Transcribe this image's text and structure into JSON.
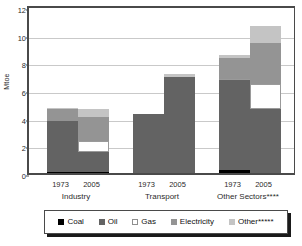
{
  "chart_data": {
    "type": "bar",
    "title": "",
    "xlabel": "",
    "ylabel": "Mtoe",
    "ylim": [
      0,
      12
    ],
    "ytick_labels": [
      "12",
      "10",
      "8",
      "6",
      "4",
      "2",
      "0"
    ],
    "yticks": [
      12,
      10,
      8,
      6,
      4,
      2,
      0
    ],
    "grid": true,
    "stacked": true,
    "legend_position": "bottom",
    "groups": [
      "Industry",
      "Transport",
      "Other Sectors****"
    ],
    "categories": [
      "1973",
      "2005",
      "1973",
      "2005",
      "1973",
      "2005"
    ],
    "series": [
      {
        "name": "Coal",
        "color": "#000000",
        "values": [
          0.1,
          0.1,
          0.0,
          0.0,
          0.2,
          0.0
        ]
      },
      {
        "name": "Oil",
        "color": "#636363",
        "values": [
          3.65,
          1.45,
          4.25,
          6.95,
          6.5,
          4.6
        ]
      },
      {
        "name": "Gas",
        "color": "#ffffff",
        "values": [
          0.0,
          0.75,
          0.0,
          0.0,
          0.1,
          1.8
        ]
      },
      {
        "name": "Electricity",
        "color": "#949494",
        "values": [
          0.85,
          1.75,
          0.0,
          0.0,
          1.55,
          3.0
        ]
      },
      {
        "name": "Other*****",
        "color": "#c4c4c4",
        "values": [
          0.1,
          0.55,
          0.0,
          0.2,
          0.2,
          1.25
        ]
      }
    ],
    "totals": [
      4.7,
      4.6,
      4.25,
      7.15,
      8.55,
      10.65
    ],
    "bars": [
      {
        "group": "Industry",
        "year": "1973",
        "total": 4.7,
        "segments": [
          {
            "series": "Coal",
            "value": 0.1
          },
          {
            "series": "Oil",
            "value": 3.65
          },
          {
            "series": "Electricity",
            "value": 0.85
          },
          {
            "series": "Other*****",
            "value": 0.1
          }
        ]
      },
      {
        "group": "Industry",
        "year": "2005",
        "total": 4.6,
        "segments": [
          {
            "series": "Coal",
            "value": 0.1
          },
          {
            "series": "Oil",
            "value": 1.45
          },
          {
            "series": "Gas",
            "value": 0.75
          },
          {
            "series": "Electricity",
            "value": 1.75
          },
          {
            "series": "Other*****",
            "value": 0.55
          }
        ]
      },
      {
        "group": "Transport",
        "year": "1973",
        "total": 4.25,
        "segments": [
          {
            "series": "Oil",
            "value": 4.25
          }
        ]
      },
      {
        "group": "Transport",
        "year": "2005",
        "total": 7.15,
        "segments": [
          {
            "series": "Oil",
            "value": 6.95
          },
          {
            "series": "Other*****",
            "value": 0.2
          }
        ]
      },
      {
        "group": "Other Sectors****",
        "year": "1973",
        "total": 8.55,
        "segments": [
          {
            "series": "Coal",
            "value": 0.2
          },
          {
            "series": "Oil",
            "value": 6.5
          },
          {
            "series": "Gas",
            "value": 0.1
          },
          {
            "series": "Electricity",
            "value": 1.55
          },
          {
            "series": "Other*****",
            "value": 0.2
          }
        ]
      },
      {
        "group": "Other Sectors****",
        "year": "2005",
        "total": 10.65,
        "segments": [
          {
            "series": "Oil",
            "value": 4.6
          },
          {
            "series": "Gas",
            "value": 1.8
          },
          {
            "series": "Electricity",
            "value": 3.0
          },
          {
            "series": "Other*****",
            "value": 1.25
          }
        ]
      }
    ],
    "legend": [
      {
        "label": "Coal",
        "color": "#000000"
      },
      {
        "label": "Oil",
        "color": "#636363"
      },
      {
        "label": "Gas",
        "color": "#ffffff"
      },
      {
        "label": "Electricity",
        "color": "#949494"
      },
      {
        "label": "Other*****",
        "color": "#c4c4c4"
      }
    ]
  }
}
